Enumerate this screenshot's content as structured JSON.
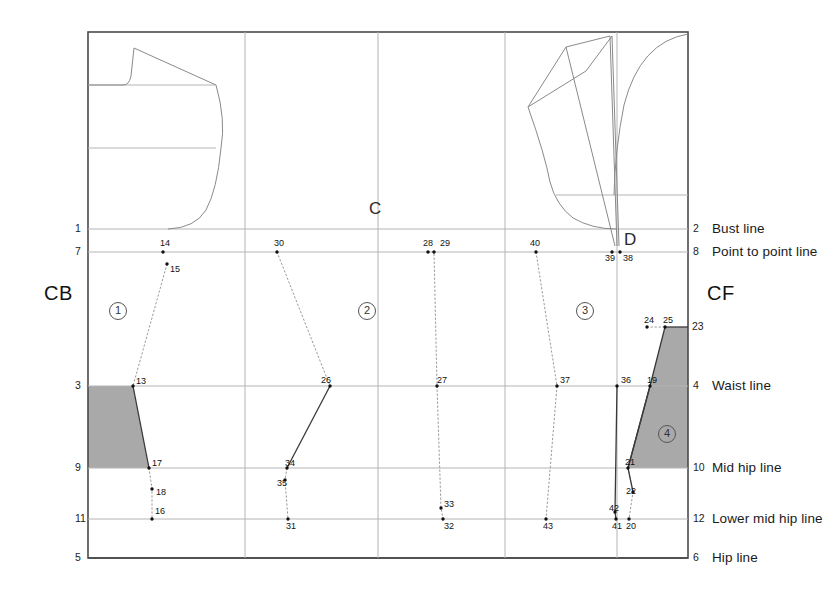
{
  "diagram": {
    "background_color": "#ffffff",
    "frame_color": "#4a4a4a",
    "grid_color": "#b4b4b4",
    "shade_color": "#a9a9a9",
    "pattern_line_color": "#8a8a8a",
    "dart_line_color": "#9a9a9a",
    "frame": {
      "x": 88,
      "y": 32,
      "width": 600,
      "height": 526
    }
  },
  "big_labels": [
    {
      "name": "center-back",
      "text": "CB",
      "x": 44,
      "y": 283
    },
    {
      "name": "center-front",
      "text": "CF",
      "x": 707,
      "y": 283
    }
  ],
  "letter_labels": [
    {
      "name": "label-c",
      "text": "C",
      "x": 369,
      "y": 200
    },
    {
      "name": "label-d",
      "text": "D",
      "x": 624,
      "y": 231
    }
  ],
  "panel_badges": [
    {
      "name": "panel-1",
      "text": "1",
      "cx": 118,
      "cy": 311
    },
    {
      "name": "panel-2",
      "text": "2",
      "cx": 367,
      "cy": 311
    },
    {
      "name": "panel-3",
      "text": "3",
      "cx": 585,
      "cy": 311
    },
    {
      "name": "panel-4",
      "text": "4",
      "cx": 667,
      "cy": 434
    }
  ],
  "horizontal_lines": [
    {
      "name": "bust-line",
      "y": 229,
      "left_num": "1",
      "right_num": "2",
      "right_label": "Bust line"
    },
    {
      "name": "point-to-point-line",
      "y": 252,
      "left_num": "7",
      "right_num": "8",
      "right_label": "Point to point line"
    },
    {
      "name": "waist-line",
      "y": 386,
      "left_num": "3",
      "right_num": "4",
      "right_label": "Waist line"
    },
    {
      "name": "mid-hip-line",
      "y": 468,
      "left_num": "9",
      "right_num": "10",
      "right_label": "Mid hip line"
    },
    {
      "name": "lower-mid-hip-line",
      "y": 519,
      "left_num": "11",
      "right_num": "12",
      "right_label": "Lower mid hip line"
    },
    {
      "name": "hip-line",
      "y": 558,
      "left_num": "5",
      "right_num": "6",
      "right_label": "Hip line"
    }
  ],
  "extra_marks": [
    {
      "name": "mark-23",
      "text": "23",
      "x": 692,
      "y": 327
    }
  ],
  "vertical_grid_x": [
    245,
    378,
    505,
    617
  ],
  "interior_horizontal_lines": [
    {
      "name": "back-chest-line",
      "y": 85,
      "x1": 88,
      "x2": 215
    },
    {
      "name": "back-waist-guide",
      "y": 148,
      "x1": 88,
      "x2": 216
    },
    {
      "name": "front-chest-guide",
      "y": 195,
      "x1": 556,
      "x2": 688
    }
  ],
  "points": [
    {
      "n": "14",
      "x": 163,
      "y": 252,
      "lx": 160,
      "ly": 244
    },
    {
      "n": "15",
      "x": 167,
      "y": 264,
      "lx": 170,
      "ly": 270
    },
    {
      "n": "13",
      "x": 133,
      "y": 386,
      "lx": 136,
      "ly": 382
    },
    {
      "n": "17",
      "x": 149,
      "y": 468,
      "lx": 152,
      "ly": 464
    },
    {
      "n": "18",
      "x": 152,
      "y": 489,
      "lx": 156,
      "ly": 493
    },
    {
      "n": "16",
      "x": 152,
      "y": 519,
      "lx": 155,
      "ly": 512
    },
    {
      "n": "30",
      "x": 277,
      "y": 252,
      "lx": 274,
      "ly": 244
    },
    {
      "n": "26",
      "x": 330,
      "y": 386,
      "lx": 321,
      "ly": 381
    },
    {
      "n": "34",
      "x": 287,
      "y": 468,
      "lx": 285,
      "ly": 464
    },
    {
      "n": "35",
      "x": 285,
      "y": 480,
      "lx": 277,
      "ly": 484
    },
    {
      "n": "31",
      "x": 288,
      "y": 519,
      "lx": 286,
      "ly": 527
    },
    {
      "n": "28",
      "x": 428,
      "y": 252,
      "lx": 423,
      "ly": 244
    },
    {
      "n": "29",
      "x": 434,
      "y": 252,
      "lx": 440,
      "ly": 244
    },
    {
      "n": "27",
      "x": 437,
      "y": 386,
      "lx": 437,
      "ly": 381
    },
    {
      "n": "33",
      "x": 441,
      "y": 508,
      "lx": 444,
      "ly": 505
    },
    {
      "n": "32",
      "x": 443,
      "y": 519,
      "lx": 444,
      "ly": 527
    },
    {
      "n": "40",
      "x": 536,
      "y": 252,
      "lx": 530,
      "ly": 244
    },
    {
      "n": "37",
      "x": 557,
      "y": 386,
      "lx": 560,
      "ly": 381
    },
    {
      "n": "43",
      "x": 546,
      "y": 519,
      "lx": 543,
      "ly": 527
    },
    {
      "n": "39",
      "x": 612,
      "y": 252,
      "lx": 605,
      "ly": 259
    },
    {
      "n": "38",
      "x": 620,
      "y": 252,
      "lx": 623,
      "ly": 259
    },
    {
      "n": "36",
      "x": 617,
      "y": 386,
      "lx": 621,
      "ly": 381
    },
    {
      "n": "19",
      "x": 650,
      "y": 386,
      "lx": 647,
      "ly": 381
    },
    {
      "n": "24",
      "x": 647,
      "y": 327,
      "lx": 644,
      "ly": 321
    },
    {
      "n": "25",
      "x": 665,
      "y": 327,
      "lx": 663,
      "ly": 321
    },
    {
      "n": "21",
      "x": 628,
      "y": 468,
      "lx": 625,
      "ly": 463
    },
    {
      "n": "22",
      "x": 633,
      "y": 492,
      "lx": 626,
      "ly": 492
    },
    {
      "n": "42",
      "x": 615,
      "y": 512,
      "lx": 609,
      "ly": 509
    },
    {
      "n": "41",
      "x": 616,
      "y": 519,
      "lx": 612,
      "ly": 527
    },
    {
      "n": "20",
      "x": 629,
      "y": 519,
      "lx": 626,
      "ly": 527
    }
  ],
  "shaded_regions": [
    {
      "name": "back-waist-shade",
      "points": "88,386 133,386 149,468 88,468"
    },
    {
      "name": "front-waist-shade",
      "points": "665,327 688,327 688,468 628,468 650,386"
    }
  ],
  "dart_paths": [
    {
      "name": "dart-panel1",
      "d": "M167,264 L133,386"
    },
    {
      "name": "dart-panel1-lower",
      "d": "M149,468 L152,489 L152,519"
    },
    {
      "name": "dart-panel2",
      "d": "M277,252 L330,386"
    },
    {
      "name": "dart-panel2-lower",
      "d": "M287,468 L285,480 L288,519"
    },
    {
      "name": "dart-panel2-mid",
      "d": "M428,252 L434,252 L437,386 L441,508 L443,519"
    },
    {
      "name": "dart-panel3",
      "d": "M536,252 L557,386 L546,519"
    },
    {
      "name": "dart-front-24-25",
      "d": "M647,327 L665,327"
    },
    {
      "name": "dart-front-lower",
      "d": "M628,468 L633,492 L629,519"
    }
  ],
  "solid_seam_paths": [
    {
      "name": "seam-13-17",
      "d": "M133,386 L149,468"
    },
    {
      "name": "seam-26-34",
      "d": "M330,386 L287,468"
    },
    {
      "name": "seam-36-42",
      "d": "M617,386 L615,512 L616,519"
    },
    {
      "name": "seam-19-22",
      "d": "M650,386 L628,468 L633,492"
    },
    {
      "name": "seam-25-23",
      "d": "M665,327 L688,327"
    },
    {
      "name": "seam-25-19",
      "d": "M665,327 L650,386 L628,468"
    }
  ],
  "bodice_back_paths": [
    {
      "name": "back-neckline",
      "d": "M88,85 L122,85 Q129,86 131,76 L134,48"
    },
    {
      "name": "back-shoulder",
      "d": "M134,48 L216,85"
    },
    {
      "name": "back-armhole",
      "d": "M216,85 Q226,120 221,148 Q217,190 206,210 Q195,228 168,229"
    }
  ],
  "bodice_front_paths": [
    {
      "name": "front-neckline",
      "d": "M688,34 Q640,42 624,105 Q615,150 614,195"
    },
    {
      "name": "front-shoulder-outer",
      "d": "M528,107 L566,47 L610,36"
    },
    {
      "name": "front-shoulder-inner",
      "d": "M528,107 L586,71 L612,36"
    },
    {
      "name": "front-armhole",
      "d": "M528,107 Q545,155 550,182 Q556,205 573,218 Q592,229 616,229"
    },
    {
      "name": "front-dart-left",
      "d": "M566,47 L615,246"
    },
    {
      "name": "front-dart-right",
      "d": "M610,36 L617,246"
    },
    {
      "name": "front-dart-edge",
      "d": "M612,36 L619,246"
    }
  ]
}
